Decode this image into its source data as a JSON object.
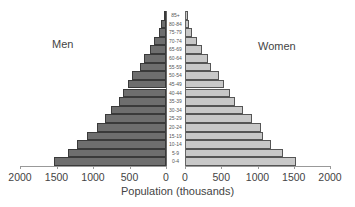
{
  "chart_data": {
    "type": "bar",
    "subtype": "population_pyramid",
    "title": "",
    "xlabel": "Population (thousands)",
    "ylabel": "",
    "categories": [
      "85+",
      "80-84",
      "75-79",
      "70-74",
      "65-69",
      "60-64",
      "55-59",
      "50-54",
      "45-49",
      "40-44",
      "35-39",
      "30-34",
      "25-29",
      "20-24",
      "15-19",
      "10-14",
      "5-9",
      "0-4"
    ],
    "series": [
      {
        "name": "Men",
        "color": "#6e6e6e",
        "values": [
          30,
          70,
          100,
          165,
          220,
          300,
          355,
          465,
          520,
          590,
          640,
          750,
          835,
          945,
          1080,
          1220,
          1340,
          1535
        ]
      },
      {
        "name": "Women",
        "color": "#c8c8c8",
        "values": [
          40,
          55,
          95,
          165,
          235,
          315,
          360,
          470,
          540,
          620,
          690,
          800,
          925,
          1050,
          1075,
          1185,
          1350,
          1530
        ]
      }
    ],
    "xlim": [
      0,
      2000
    ],
    "xticks_left": [
      "2000",
      "1500",
      "1000",
      "500",
      "0"
    ],
    "xticks_right": [
      "0",
      "500",
      "1000",
      "1500",
      "2000"
    ],
    "grid": false,
    "legend": "side labels (Men left, Women right)"
  },
  "labels": {
    "men": "Men",
    "women": "Women",
    "xlabel": "Population (thousands)"
  }
}
